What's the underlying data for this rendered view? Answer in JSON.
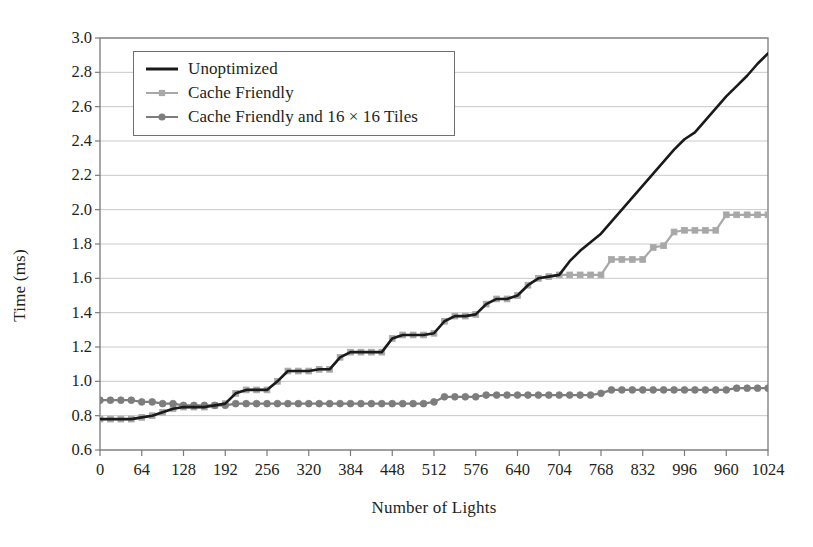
{
  "chart_data": {
    "type": "line",
    "title": "",
    "xlabel": "Number of Lights",
    "ylabel": "Time (ms)",
    "xlim": [
      0,
      1024
    ],
    "ylim": [
      0.6,
      3.0
    ],
    "grid": "horizontal",
    "legend_position": "upper-left-inside",
    "y_ticks": [
      "3.0",
      "2.8",
      "2.6",
      "2.4",
      "2.2",
      "2.0",
      "1.8",
      "1.6",
      "1.4",
      "1.2",
      "1.0",
      "0.8",
      "0.6"
    ],
    "y_tick_values": [
      3.0,
      2.8,
      2.6,
      2.4,
      2.2,
      2.0,
      1.8,
      1.6,
      1.4,
      1.2,
      1.0,
      0.8,
      0.6
    ],
    "x_ticks": [
      "0",
      "64",
      "128",
      "192",
      "256",
      "320",
      "384",
      "448",
      "512",
      "576",
      "640",
      "704",
      "768",
      "832",
      "996",
      "960",
      "1024"
    ],
    "x_tick_values": [
      0,
      64,
      128,
      192,
      256,
      320,
      384,
      448,
      512,
      576,
      640,
      704,
      768,
      832,
      896,
      960,
      1024
    ],
    "x": [
      0,
      16,
      32,
      48,
      64,
      80,
      96,
      112,
      128,
      144,
      160,
      176,
      192,
      208,
      224,
      240,
      256,
      272,
      288,
      304,
      320,
      336,
      352,
      368,
      384,
      400,
      416,
      432,
      448,
      464,
      480,
      496,
      512,
      528,
      544,
      560,
      576,
      592,
      608,
      624,
      640,
      656,
      672,
      688,
      704,
      720,
      736,
      752,
      768,
      784,
      800,
      816,
      832,
      848,
      864,
      880,
      896,
      912,
      928,
      944,
      960,
      976,
      992,
      1008,
      1024
    ],
    "series": [
      {
        "name": "Unoptimized",
        "color": "#1a1a1a",
        "marker": "none",
        "width": 2.6,
        "values": [
          0.78,
          0.78,
          0.78,
          0.78,
          0.79,
          0.8,
          0.82,
          0.84,
          0.85,
          0.85,
          0.85,
          0.86,
          0.87,
          0.93,
          0.95,
          0.95,
          0.95,
          1.0,
          1.06,
          1.06,
          1.06,
          1.07,
          1.07,
          1.14,
          1.17,
          1.17,
          1.17,
          1.17,
          1.25,
          1.27,
          1.27,
          1.27,
          1.28,
          1.35,
          1.38,
          1.38,
          1.39,
          1.45,
          1.48,
          1.48,
          1.5,
          1.56,
          1.6,
          1.61,
          1.62,
          1.7,
          1.76,
          1.81,
          1.86,
          1.93,
          2.0,
          2.07,
          2.14,
          2.21,
          2.28,
          2.35,
          2.41,
          2.45,
          2.52,
          2.59,
          2.66,
          2.72,
          2.78,
          2.85,
          2.91
        ]
      },
      {
        "name": "Cache Friendly",
        "color": "#a8a8a8",
        "marker": "square",
        "width": 2.2,
        "values": [
          0.78,
          0.78,
          0.78,
          0.78,
          0.79,
          0.8,
          0.82,
          0.84,
          0.85,
          0.85,
          0.85,
          0.86,
          0.87,
          0.93,
          0.95,
          0.95,
          0.95,
          1.0,
          1.06,
          1.06,
          1.06,
          1.07,
          1.07,
          1.14,
          1.17,
          1.17,
          1.17,
          1.17,
          1.25,
          1.27,
          1.27,
          1.27,
          1.28,
          1.35,
          1.38,
          1.38,
          1.39,
          1.45,
          1.48,
          1.48,
          1.5,
          1.56,
          1.6,
          1.61,
          1.62,
          1.62,
          1.62,
          1.62,
          1.62,
          1.71,
          1.71,
          1.71,
          1.71,
          1.78,
          1.79,
          1.87,
          1.88,
          1.88,
          1.88,
          1.88,
          1.97,
          1.97,
          1.97,
          1.97,
          1.97
        ]
      },
      {
        "name": "Cache Friendly and 16 × 16 Tiles",
        "color": "#7d7d7d",
        "marker": "circle",
        "width": 2.2,
        "values": [
          0.89,
          0.89,
          0.89,
          0.89,
          0.88,
          0.88,
          0.87,
          0.87,
          0.86,
          0.86,
          0.86,
          0.86,
          0.86,
          0.87,
          0.87,
          0.87,
          0.87,
          0.87,
          0.87,
          0.87,
          0.87,
          0.87,
          0.87,
          0.87,
          0.87,
          0.87,
          0.87,
          0.87,
          0.87,
          0.87,
          0.87,
          0.87,
          0.88,
          0.91,
          0.91,
          0.91,
          0.91,
          0.92,
          0.92,
          0.92,
          0.92,
          0.92,
          0.92,
          0.92,
          0.92,
          0.92,
          0.92,
          0.92,
          0.93,
          0.95,
          0.95,
          0.95,
          0.95,
          0.95,
          0.95,
          0.95,
          0.95,
          0.95,
          0.95,
          0.95,
          0.95,
          0.96,
          0.96,
          0.96,
          0.96
        ]
      }
    ]
  },
  "legend": {
    "entries": [
      {
        "label": "Unoptimized"
      },
      {
        "label": "Cache Friendly"
      },
      {
        "label": "Cache Friendly and 16 × 16 Tiles"
      }
    ]
  },
  "axes": {
    "x_title": "Number of Lights",
    "y_title": "Time (ms)"
  },
  "style": {
    "plot_background": "#ffffff",
    "grid_color": "#c9c9c9",
    "frame_color": "#7a7a7a",
    "text_color": "#231f20"
  }
}
